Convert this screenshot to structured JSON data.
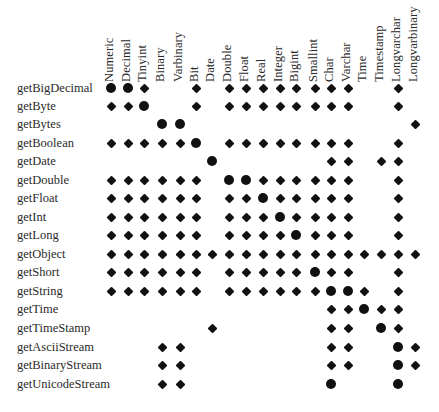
{
  "legend": {
    "big": "recommended",
    "small": "allowed"
  },
  "columns": [
    "Numeric",
    "Decimal",
    "Tinyint",
    "Binary",
    "Varbinary",
    "Bit",
    "Date",
    "Double",
    "Float",
    "Real",
    "Integer",
    "Bigint",
    "Smallint",
    "Char",
    "Varchar",
    "Time",
    "Timestamp",
    "Longvarchar",
    "Longvarbinary"
  ],
  "column_x": [
    111,
    128,
    144,
    162,
    180,
    196,
    212,
    229,
    246,
    263,
    280,
    296,
    315,
    331,
    348,
    364,
    381,
    398,
    415
  ],
  "rows": [
    {
      "label": "getBigDecimal",
      "y": 88,
      "cells": [
        "X",
        "X",
        "x",
        "",
        "",
        "x",
        "",
        "x",
        "x",
        "x",
        "x",
        "x",
        "x",
        "x",
        "x",
        "",
        "",
        "x",
        ""
      ]
    },
    {
      "label": "getByte",
      "y": 106,
      "cells": [
        "x",
        "x",
        "X",
        "",
        "",
        "x",
        "",
        "x",
        "x",
        "x",
        "x",
        "x",
        "x",
        "x",
        "x",
        "",
        "",
        "x",
        ""
      ]
    },
    {
      "label": "getBytes",
      "y": 124,
      "cells": [
        "",
        "",
        "",
        "X",
        "X",
        "",
        "",
        "",
        "",
        "",
        "",
        "",
        "",
        "",
        "",
        "",
        "",
        "",
        "x"
      ]
    },
    {
      "label": "getBoolean",
      "y": 143,
      "cells": [
        "x",
        "x",
        "x",
        "x",
        "x",
        "X",
        "",
        "x",
        "x",
        "x",
        "x",
        "x",
        "x",
        "x",
        "x",
        "",
        "",
        "x",
        ""
      ]
    },
    {
      "label": "getDate",
      "y": 161,
      "cells": [
        "",
        "",
        "",
        "",
        "",
        "",
        "X",
        "",
        "",
        "",
        "",
        "",
        "",
        "x",
        "x",
        "",
        "x",
        "x",
        ""
      ]
    },
    {
      "label": "getDouble",
      "y": 180,
      "cells": [
        "x",
        "x",
        "x",
        "x",
        "x",
        "x",
        "",
        "X",
        "X",
        "x",
        "x",
        "x",
        "x",
        "x",
        "x",
        "",
        "",
        "x",
        ""
      ]
    },
    {
      "label": "getFloat",
      "y": 198,
      "cells": [
        "x",
        "x",
        "x",
        "x",
        "x",
        "x",
        "",
        "x",
        "x",
        "X",
        "x",
        "x",
        "x",
        "x",
        "x",
        "",
        "",
        "x",
        ""
      ]
    },
    {
      "label": "getInt",
      "y": 217,
      "cells": [
        "x",
        "x",
        "x",
        "x",
        "x",
        "x",
        "",
        "x",
        "x",
        "x",
        "X",
        "x",
        "x",
        "x",
        "x",
        "",
        "",
        "x",
        ""
      ]
    },
    {
      "label": "getLong",
      "y": 235,
      "cells": [
        "x",
        "x",
        "x",
        "x",
        "x",
        "x",
        "",
        "x",
        "x",
        "x",
        "x",
        "X",
        "x",
        "x",
        "x",
        "",
        "",
        "x",
        ""
      ]
    },
    {
      "label": "getObject",
      "y": 254,
      "cells": [
        "x",
        "x",
        "x",
        "x",
        "x",
        "x",
        "x",
        "x",
        "x",
        "x",
        "x",
        "x",
        "x",
        "x",
        "x",
        "x",
        "x",
        "x",
        "x"
      ]
    },
    {
      "label": "getShort",
      "y": 272,
      "cells": [
        "x",
        "x",
        "x",
        "x",
        "x",
        "x",
        "",
        "x",
        "x",
        "x",
        "x",
        "x",
        "X",
        "x",
        "x",
        "",
        "",
        "x",
        ""
      ]
    },
    {
      "label": "getString",
      "y": 291,
      "cells": [
        "x",
        "x",
        "x",
        "x",
        "x",
        "x",
        "",
        "x",
        "x",
        "x",
        "x",
        "x",
        "x",
        "X",
        "X",
        "x",
        "",
        "x",
        ""
      ]
    },
    {
      "label": "getTime",
      "y": 309,
      "cells": [
        "",
        "",
        "",
        "",
        "",
        "",
        "",
        "",
        "",
        "",
        "",
        "",
        "",
        "x",
        "x",
        "X",
        "x",
        "x",
        ""
      ]
    },
    {
      "label": "getTimeStamp",
      "y": 328,
      "cells": [
        "",
        "",
        "",
        "",
        "",
        "",
        "x",
        "",
        "",
        "",
        "",
        "",
        "",
        "x",
        "x",
        "",
        "X",
        "x",
        ""
      ]
    },
    {
      "label": "getAsciiStream",
      "y": 347,
      "cells": [
        "",
        "",
        "",
        "x",
        "x",
        "",
        "",
        "",
        "",
        "",
        "",
        "",
        "",
        "x",
        "x",
        "",
        "",
        "X",
        "x"
      ]
    },
    {
      "label": "getBinaryStream",
      "y": 365,
      "cells": [
        "",
        "",
        "",
        "x",
        "x",
        "",
        "",
        "",
        "",
        "",
        "",
        "",
        "",
        "x",
        "x",
        "",
        "",
        "X",
        "x"
      ]
    },
    {
      "label": "getUnicodeStream",
      "y": 384,
      "cells": [
        "",
        "",
        "",
        "x",
        "x",
        "",
        "",
        "",
        "",
        "",
        "",
        "",
        "",
        "X",
        "",
        "",
        "",
        "X",
        ""
      ]
    }
  ],
  "chart_data": {
    "type": "table",
    "title": "",
    "x": [
      "Numeric",
      "Decimal",
      "Tinyint",
      "Binary",
      "Varbinary",
      "Bit",
      "Date",
      "Double",
      "Float",
      "Real",
      "Integer",
      "Bigint",
      "Smallint",
      "Char",
      "Varchar",
      "Time",
      "Timestamp",
      "Longvarchar",
      "Longvarbinary"
    ],
    "y": [
      "getBigDecimal",
      "getByte",
      "getBytes",
      "getBoolean",
      "getDate",
      "getDouble",
      "getFloat",
      "getInt",
      "getLong",
      "getObject",
      "getShort",
      "getString",
      "getTime",
      "getTimeStamp",
      "getAsciiStream",
      "getBinaryStream",
      "getUnicodeStream"
    ],
    "encoding": {
      "X": "large dot (recommended)",
      "x": "diamond (allowed)",
      "": "not supported"
    }
  }
}
